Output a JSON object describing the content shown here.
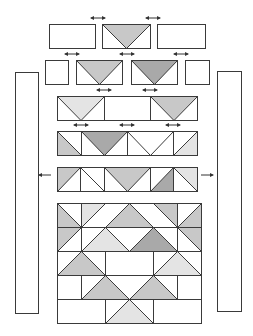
{
  "diagram": {
    "type": "quilt-assembly",
    "colors": {
      "outline": "#3a3a3a",
      "light": "#e4e4e4",
      "medium": "#c8c8c8",
      "dark": "#a9a9a9",
      "background": "#ffffff"
    },
    "side_borders": [
      {
        "name": "left-border-strip",
        "x": 15,
        "y": 72,
        "w": 23,
        "h": 241
      },
      {
        "name": "right-border-strip",
        "x": 217,
        "y": 71,
        "w": 24,
        "h": 240
      }
    ],
    "rows": [
      {
        "name": "row-1",
        "y": 24,
        "h": 24,
        "blocks": [
          {
            "kind": "rect",
            "x": 49,
            "w": 46
          },
          {
            "kind": "goose-down",
            "x": 102,
            "w": 48,
            "fill": "medium"
          },
          {
            "kind": "rect",
            "x": 157,
            "w": 48
          }
        ],
        "arrows": [
          {
            "x": 98,
            "y": 18
          },
          {
            "x": 153,
            "y": 18
          }
        ]
      },
      {
        "name": "row-2",
        "y": 60,
        "h": 24,
        "blocks": [
          {
            "kind": "rect",
            "x": 45,
            "w": 23
          },
          {
            "kind": "goose-down",
            "x": 76,
            "w": 46,
            "fill": "medium"
          },
          {
            "kind": "goose-down",
            "x": 131,
            "w": 46,
            "fill": "dark"
          },
          {
            "kind": "rect",
            "x": 185,
            "w": 24
          }
        ],
        "arrows": [
          {
            "x": 72,
            "y": 54
          },
          {
            "x": 127,
            "y": 54
          },
          {
            "x": 181,
            "y": 54
          }
        ]
      },
      {
        "name": "row-3",
        "y": 96,
        "h": 24,
        "blocks": [
          {
            "kind": "goose-down",
            "x": 57,
            "w": 47,
            "fill": "light"
          },
          {
            "kind": "rect",
            "x": 104,
            "w": 46
          },
          {
            "kind": "goose-down",
            "x": 150,
            "w": 47,
            "fill": "medium"
          }
        ],
        "arrows": [
          {
            "x": 104,
            "y": 90
          },
          {
            "x": 150,
            "y": 90
          }
        ]
      },
      {
        "name": "row-4",
        "y": 131,
        "h": 24,
        "blocks": [
          {
            "kind": "hst",
            "x": 57,
            "w": 24,
            "diag": "tl-br",
            "shade": "bl",
            "fill": "medium"
          },
          {
            "kind": "goose-down",
            "x": 81,
            "w": 46,
            "fill": "dark"
          },
          {
            "kind": "goose-down",
            "x": 127,
            "w": 46,
            "fill": "white"
          },
          {
            "kind": "hst",
            "x": 173,
            "w": 24,
            "diag": "tr-bl",
            "shade": "br",
            "fill": "light"
          }
        ],
        "arrows": [
          {
            "x": 81,
            "y": 125
          },
          {
            "x": 127,
            "y": 125
          },
          {
            "x": 173,
            "y": 125
          }
        ]
      },
      {
        "name": "row-5",
        "y": 167,
        "h": 24,
        "blocks": [
          {
            "kind": "hst",
            "x": 57,
            "w": 23,
            "diag": "tr-bl",
            "shade": "tl",
            "fill": "medium"
          },
          {
            "kind": "hst",
            "x": 80,
            "w": 24,
            "diag": "tl-br",
            "shade": "none",
            "fill": "white"
          },
          {
            "kind": "goose-down",
            "x": 104,
            "w": 46,
            "fill": "medium"
          },
          {
            "kind": "hst",
            "x": 150,
            "w": 23,
            "diag": "tr-bl",
            "shade": "br",
            "fill": "dark"
          },
          {
            "kind": "hst",
            "x": 173,
            "w": 24,
            "diag": "tl-br",
            "shade": "tr",
            "fill": "light"
          }
        ],
        "arrows_out": [
          {
            "x": 45,
            "y": 175,
            "dir": "left"
          },
          {
            "x": 207,
            "y": 175,
            "dir": "right"
          }
        ]
      }
    ],
    "center_block": {
      "name": "center-block",
      "x": 57,
      "y": 203,
      "cols": 6,
      "rows": 5,
      "cell": 24,
      "triangles": [
        {
          "pts": [
            [
              0,
              0
            ],
            [
              0,
              1
            ],
            [
              1,
              1
            ]
          ],
          "fill": "medium"
        },
        {
          "pts": [
            [
              1,
              0
            ],
            [
              2,
              0
            ],
            [
              1,
              1
            ]
          ],
          "fill": "light"
        },
        {
          "pts": [
            [
              2,
              1
            ],
            [
              3,
              0
            ],
            [
              4,
              1
            ]
          ],
          "fill": "medium"
        },
        {
          "pts": [
            [
              4,
              0
            ],
            [
              5,
              0
            ],
            [
              5,
              1
            ]
          ],
          "fill": "medium"
        },
        {
          "pts": [
            [
              5,
              1
            ],
            [
              6,
              0
            ],
            [
              6,
              1
            ]
          ],
          "fill": "medium"
        },
        {
          "pts": [
            [
              0,
              1
            ],
            [
              1,
              1
            ],
            [
              0,
              2
            ]
          ],
          "fill": "medium"
        },
        {
          "pts": [
            [
              1,
              2
            ],
            [
              2,
              1
            ],
            [
              3,
              2
            ]
          ],
          "fill": "light"
        },
        {
          "pts": [
            [
              3,
              2
            ],
            [
              4,
              1
            ],
            [
              5,
              2
            ]
          ],
          "fill": "dark"
        },
        {
          "pts": [
            [
              5,
              1
            ],
            [
              6,
              1
            ],
            [
              6,
              2
            ]
          ],
          "fill": "medium"
        },
        {
          "pts": [
            [
              0,
              3
            ],
            [
              1,
              2
            ],
            [
              2,
              3
            ]
          ],
          "fill": "medium"
        },
        {
          "pts": [
            [
              4,
              3
            ],
            [
              5,
              2
            ],
            [
              6,
              3
            ]
          ],
          "fill": "light"
        },
        {
          "pts": [
            [
              1,
              4
            ],
            [
              2,
              3
            ],
            [
              3,
              4
            ]
          ],
          "fill": "medium"
        },
        {
          "pts": [
            [
              3,
              4
            ],
            [
              4,
              3
            ],
            [
              5,
              4
            ]
          ],
          "fill": "medium"
        },
        {
          "pts": [
            [
              2,
              5
            ],
            [
              3,
              4
            ],
            [
              4,
              5
            ]
          ],
          "fill": "light"
        }
      ],
      "lines": [
        [
          [
            0,
            0
          ],
          [
            1,
            1
          ]
        ],
        [
          [
            1,
            1
          ],
          [
            2,
            0
          ]
        ],
        [
          [
            1,
            1
          ],
          [
            1,
            0
          ]
        ],
        [
          [
            2,
            1
          ],
          [
            3,
            0
          ]
        ],
        [
          [
            3,
            0
          ],
          [
            4,
            1
          ]
        ],
        [
          [
            4,
            0
          ],
          [
            5,
            1
          ]
        ],
        [
          [
            5,
            1
          ],
          [
            6,
            0
          ]
        ],
        [
          [
            5,
            1
          ],
          [
            5,
            0
          ]
        ],
        [
          [
            0,
            2
          ],
          [
            1,
            1
          ]
        ],
        [
          [
            1,
            1
          ],
          [
            1,
            2
          ]
        ],
        [
          [
            1,
            2
          ],
          [
            2,
            1
          ]
        ],
        [
          [
            2,
            1
          ],
          [
            3,
            2
          ]
        ],
        [
          [
            3,
            2
          ],
          [
            4,
            1
          ]
        ],
        [
          [
            4,
            1
          ],
          [
            5,
            2
          ]
        ],
        [
          [
            5,
            1
          ],
          [
            6,
            2
          ]
        ],
        [
          [
            5,
            1
          ],
          [
            5,
            2
          ]
        ],
        [
          [
            0,
            3
          ],
          [
            1,
            2
          ]
        ],
        [
          [
            1,
            2
          ],
          [
            2,
            3
          ]
        ],
        [
          [
            2,
            2
          ],
          [
            2,
            3
          ]
        ],
        [
          [
            4,
            3
          ],
          [
            5,
            2
          ]
        ],
        [
          [
            5,
            2
          ],
          [
            6,
            3
          ]
        ],
        [
          [
            4,
            2
          ],
          [
            4,
            3
          ]
        ],
        [
          [
            1,
            3
          ],
          [
            1,
            4
          ]
        ],
        [
          [
            1,
            4
          ],
          [
            2,
            3
          ]
        ],
        [
          [
            2,
            3
          ],
          [
            3,
            4
          ]
        ],
        [
          [
            3,
            4
          ],
          [
            4,
            3
          ]
        ],
        [
          [
            4,
            3
          ],
          [
            5,
            4
          ]
        ],
        [
          [
            5,
            3
          ],
          [
            5,
            4
          ]
        ],
        [
          [
            2,
            5
          ],
          [
            3,
            4
          ]
        ],
        [
          [
            3,
            4
          ],
          [
            4,
            5
          ]
        ],
        [
          [
            2,
            4
          ],
          [
            2,
            5
          ]
        ],
        [
          [
            4,
            4
          ],
          [
            4,
            5
          ]
        ]
      ],
      "row_lines": [
        1,
        2,
        3,
        4
      ]
    }
  }
}
